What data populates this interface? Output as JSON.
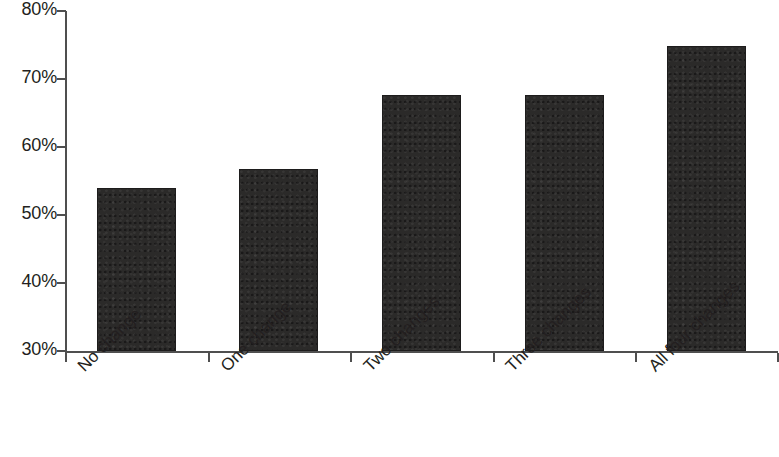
{
  "chart_data": {
    "type": "bar",
    "title": "",
    "subtitle": "",
    "xlabel": "",
    "ylabel": "",
    "categories": [
      "No change",
      "One change",
      "Two changes",
      "Three changes",
      "All four changes"
    ],
    "values": [
      54.0,
      56.8,
      67.7,
      67.7,
      74.8
    ],
    "value_labels": [
      "",
      "",
      "",
      "",
      ""
    ],
    "ylim": [
      30,
      80
    ],
    "y_ticks": [
      30,
      40,
      50,
      60,
      70,
      80
    ],
    "y_tick_labels": [
      "30%",
      "40%",
      "50%",
      "60%",
      "70%",
      "80%"
    ],
    "grid": false,
    "legend": null,
    "legend_position": "none",
    "bar_color": "#2b2a29",
    "axis_color": "#4f4f4f",
    "text_color": "#231f20",
    "background_color": "#ffffff",
    "x_tick_style": "between-categories",
    "x_label_rotation_deg": -45
  }
}
